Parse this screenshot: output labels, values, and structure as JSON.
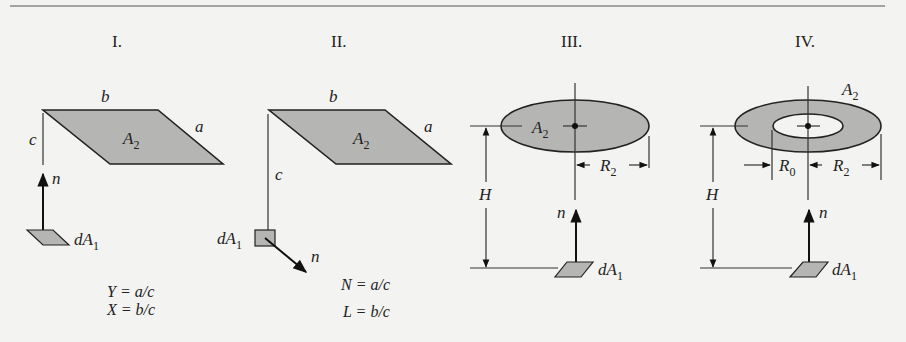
{
  "colors": {
    "background": "#f3f3f1",
    "shade": "#b5b5b3",
    "ink": "#222222"
  },
  "panels": [
    {
      "title": "I.",
      "labels": {
        "b": "b",
        "a": "a",
        "c": "c",
        "area": "A",
        "area_sub": "2",
        "normal": "n",
        "element": "dA",
        "element_sub": "1"
      },
      "equations": [
        "Y = a/c",
        "X = b/c"
      ]
    },
    {
      "title": "II.",
      "labels": {
        "b": "b",
        "a": "a",
        "c": "c",
        "area": "A",
        "area_sub": "2",
        "normal": "n",
        "element": "dA",
        "element_sub": "1"
      },
      "equations": [
        "N = a/c",
        "L = b/c"
      ]
    },
    {
      "title": "III.",
      "labels": {
        "area": "A",
        "area_sub": "2",
        "radius": "R",
        "radius_sub": "2",
        "height": "H",
        "normal": "n",
        "element": "dA",
        "element_sub": "1"
      }
    },
    {
      "title": "IV.",
      "labels": {
        "area": "A",
        "area_sub": "2",
        "inner_radius": "R",
        "inner_radius_sub": "0",
        "radius": "R",
        "radius_sub": "2",
        "height": "H",
        "normal": "n",
        "element": "dA",
        "element_sub": "1"
      }
    }
  ]
}
